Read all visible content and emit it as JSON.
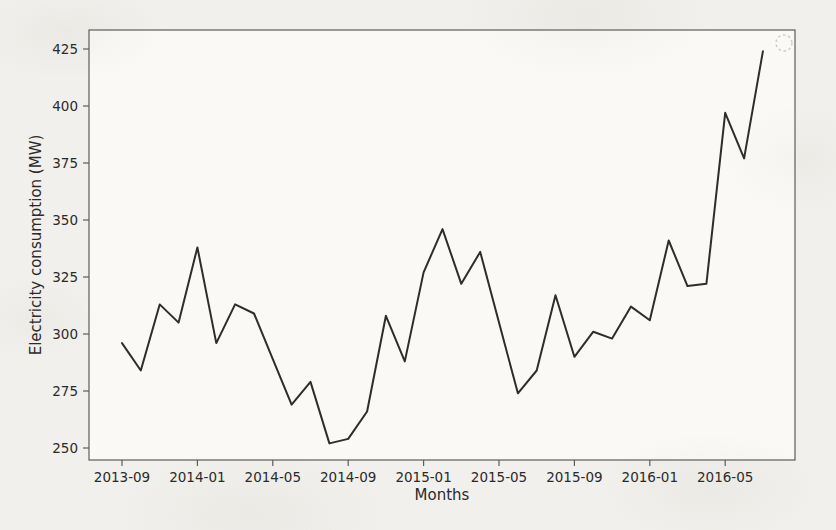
{
  "chart_data": {
    "type": "line",
    "title": "",
    "xlabel": "Months",
    "ylabel": "Electricity consumption (MW)",
    "x": [
      "2013-09",
      "2013-10",
      "2013-11",
      "2013-12",
      "2014-01",
      "2014-02",
      "2014-03",
      "2014-04",
      "2014-05",
      "2014-06",
      "2014-07",
      "2014-08",
      "2014-09",
      "2014-10",
      "2014-11",
      "2014-12",
      "2015-01",
      "2015-02",
      "2015-03",
      "2015-04",
      "2015-05",
      "2015-06",
      "2015-07",
      "2015-08",
      "2015-09",
      "2015-10",
      "2015-11",
      "2015-12",
      "2016-01",
      "2016-02",
      "2016-03",
      "2016-04",
      "2016-05",
      "2016-06",
      "2016-07"
    ],
    "values": [
      296,
      284,
      313,
      305,
      338,
      296,
      313,
      309,
      289,
      269,
      279,
      252,
      254,
      266,
      308,
      288,
      327,
      346,
      322,
      336,
      305,
      274,
      284,
      317,
      290,
      301,
      298,
      312,
      306,
      341,
      321,
      322,
      397,
      377,
      424
    ],
    "yticks": [
      250,
      275,
      300,
      325,
      350,
      375,
      400,
      425
    ],
    "xtick_labels": [
      "2013-09",
      "2014-01",
      "2014-05",
      "2014-09",
      "2015-01",
      "2015-05",
      "2015-09",
      "2016-01",
      "2016-05"
    ],
    "ylim": [
      245,
      433
    ],
    "grid": false,
    "legend_position": "none",
    "annotations": [
      "faint dashed circle near top-right corner of plot"
    ]
  },
  "colors": {
    "line": "#2d2d2d",
    "spine": "#5c5c5a",
    "text": "#2a2a2a",
    "background": "#f1f0ec",
    "plot_background": "#faf9f6",
    "annotation_circle": "#c9c8c2"
  }
}
